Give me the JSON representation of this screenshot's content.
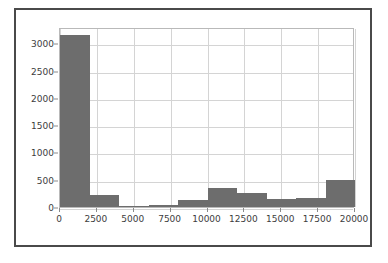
{
  "chart_data": {
    "type": "bar",
    "title": "",
    "xlabel": "",
    "ylabel": "",
    "grid": true,
    "legend": false,
    "bar_color": "#6d6d6d",
    "xlim": [
      0,
      20000
    ],
    "ylim": [
      0,
      3300
    ],
    "bin_edges": [
      0,
      2000,
      4000,
      6000,
      8000,
      10000,
      12000,
      14000,
      16000,
      18000,
      20000
    ],
    "categories": [
      "0-2000",
      "2000-4000",
      "4000-6000",
      "6000-8000",
      "8000-10000",
      "10000-12000",
      "12000-14000",
      "14000-16000",
      "16000-18000",
      "18000-20000"
    ],
    "values": [
      3150,
      215,
      25,
      45,
      120,
      340,
      250,
      140,
      160,
      500
    ],
    "xticks": [
      0,
      2500,
      5000,
      7500,
      10000,
      12500,
      15000,
      17500,
      20000
    ],
    "xtick_labels": [
      "0",
      "2500",
      "5000",
      "7500",
      "10000",
      "12500",
      "15000",
      "17500",
      "20000"
    ],
    "yticks": [
      0,
      500,
      1000,
      1500,
      2000,
      2500,
      3000
    ],
    "ytick_labels": [
      "0",
      "500",
      "1000",
      "1500",
      "2000",
      "2500",
      "3000"
    ]
  }
}
